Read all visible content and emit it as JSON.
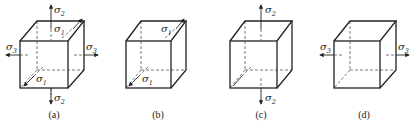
{
  "figure": {
    "panels": [
      {
        "id": "a",
        "caption": "(a)",
        "stresses": [
          "σ1",
          "σ2",
          "σ3"
        ],
        "labels": {
          "s2_top": "σ",
          "s2_top_sub": "2",
          "s1_top": "σ",
          "s1_top_sub": "1",
          "s3_left": "σ",
          "s3_left_sub": "3",
          "s3_right": "σ",
          "s3_right_sub": "3",
          "s1_bottom": "σ",
          "s1_bottom_sub": "1",
          "s2_bottom": "σ",
          "s2_bottom_sub": "2"
        }
      },
      {
        "id": "b",
        "caption": "(b)",
        "stresses": [
          "σ1"
        ],
        "labels": {
          "s1_top": "σ",
          "s1_top_sub": "1",
          "s1_bottom": "σ",
          "s1_bottom_sub": "1"
        }
      },
      {
        "id": "c",
        "caption": "(c)",
        "stresses": [
          "σ2"
        ],
        "labels": {
          "s2_top": "σ",
          "s2_top_sub": "2",
          "s2_bottom": "σ",
          "s2_bottom_sub": "2"
        }
      },
      {
        "id": "d",
        "caption": "(d)",
        "stresses": [
          "σ3"
        ],
        "labels": {
          "s3_left": "σ",
          "s3_left_sub": "3",
          "s3_right": "σ",
          "s3_right_sub": "3"
        }
      }
    ]
  }
}
